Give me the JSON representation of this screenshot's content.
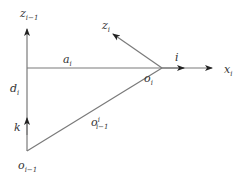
{
  "diagram": {
    "type": "coordinate-frame-geometry",
    "colors": {
      "line": "#7a7a7a",
      "arrow": "#222222",
      "text": "#333333",
      "background": "#ffffff"
    },
    "labels": {
      "z_prev": {
        "base": "z",
        "sub": "i−1"
      },
      "z_i": {
        "base": "z",
        "sub": "i"
      },
      "a_i": {
        "base": "a",
        "sub": "i"
      },
      "i_vec": {
        "base": "i"
      },
      "x_i": {
        "base": "x",
        "sub": "i"
      },
      "o_i": {
        "base": "o",
        "sub": "i"
      },
      "d_i": {
        "base": "d",
        "sub": "i"
      },
      "k_vec": {
        "base": "k"
      },
      "o_i_prev_vec": {
        "base": "o",
        "sup": "i",
        "sub": "i−1"
      },
      "o_prev": {
        "base": "o",
        "sub": "i−1"
      }
    },
    "points": {
      "o_prev": [
        27,
        151
      ],
      "corner": [
        27,
        68
      ],
      "o_i": [
        162,
        68
      ],
      "z_prev_tip": [
        27,
        28
      ],
      "z_i_tip": [
        112,
        33
      ],
      "x_i_tip": [
        212,
        68
      ]
    }
  }
}
